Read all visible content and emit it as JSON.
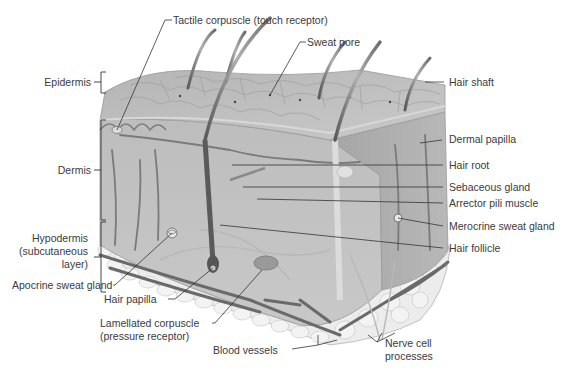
{
  "diagram": {
    "colors": {
      "tissue_light": "#c9c9c9",
      "tissue_mid": "#a8a8a8",
      "tissue_dark": "#8a8a8a",
      "fat": "#e9e9e9",
      "vessel": "#6e6e6e",
      "hair": "#7a7a7a",
      "leader_line": "#333333",
      "text": "#3a3a3a"
    },
    "layer_labels": {
      "epidermis": "Epidermis",
      "dermis": "Dermis",
      "hypodermis_1": "Hypodermis",
      "hypodermis_2": "(subcutaneous",
      "hypodermis_3": "layer)"
    },
    "labels": {
      "tactile_corpuscle": "Tactile corpuscle (touch receptor)",
      "sweat_pore": "Sweat pore",
      "hair_shaft": "Hair shaft",
      "dermal_papilla": "Dermal papilla",
      "hair_root": "Hair root",
      "sebaceous_gland": "Sebaceous gland",
      "arrector_pili": "Arrector pili muscle",
      "merocrine_sweat_gland": "Merocrine sweat gland",
      "hair_follicle": "Hair follicle",
      "apocrine_sweat_gland": "Apocrine sweat gland",
      "hair_papilla": "Hair papilla",
      "lamellated_1": "Lamellated corpuscle",
      "lamellated_2": "(pressure receptor)",
      "blood_vessels": "Blood vessels",
      "nerve_1": "Nerve cell",
      "nerve_2": "processes"
    }
  }
}
